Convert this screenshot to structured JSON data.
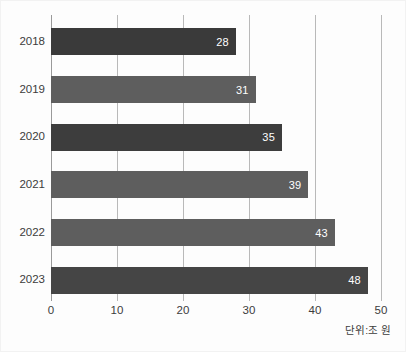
{
  "chart_data": {
    "type": "bar",
    "orientation": "horizontal",
    "title": "",
    "xlabel": "",
    "ylabel": "",
    "categories": [
      "2018",
      "2019",
      "2020",
      "2021",
      "2022",
      "2023"
    ],
    "values": [
      28,
      31,
      35,
      39,
      43,
      48
    ],
    "value_labels": [
      "28",
      "31",
      "35",
      "39",
      "43",
      "48"
    ],
    "bar_colors": [
      "#3a3a3a",
      "#5e5e5e",
      "#3d3d3d",
      "#5e5e5e",
      "#5e5e5e",
      "#454545"
    ],
    "xlim": [
      0,
      50
    ],
    "xticks": [
      0,
      10,
      20,
      30,
      40,
      50
    ],
    "xtick_labels": [
      "0",
      "10",
      "20",
      "30",
      "40",
      "50"
    ],
    "grid": true,
    "gridlines_at": [
      10,
      20,
      30,
      40,
      50
    ],
    "legend": null,
    "annotations": [
      {
        "name": "unit-note",
        "text": "단위:조 원"
      }
    ]
  },
  "colors": {
    "background": "#fdfdfd",
    "bar_dark": "#3a3a3a",
    "bar_light": "#5e5e5e",
    "gridline": "#b9b9b9",
    "axis": "#9a9a9a",
    "text": "#3c3c3c",
    "value_text": "#ffffff"
  }
}
